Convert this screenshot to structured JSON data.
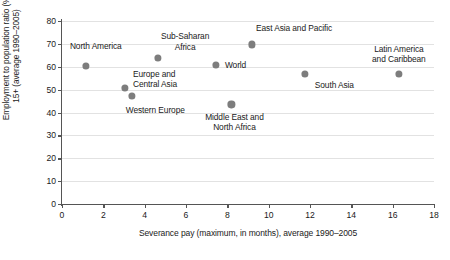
{
  "chart_data": {
    "type": "scatter",
    "title": "",
    "xlabel": "Severance pay (maximum, in months), average 1990–2005",
    "ylabel_line1": "Employment to population ratio (%),",
    "ylabel_line2": "15+ (average 1990–2005)",
    "xlim": [
      0,
      18
    ],
    "ylim": [
      0,
      80
    ],
    "xticks": [
      0,
      2,
      4,
      6,
      8,
      10,
      12,
      14,
      16,
      18
    ],
    "yticks": [
      0,
      10,
      20,
      30,
      40,
      50,
      60,
      70,
      80
    ],
    "grid": "horizontal",
    "legend": "none",
    "marker_color": "#7d7d7d",
    "axis_color": "#555555",
    "gridline_color": "#e2e2e2",
    "points": [
      {
        "label": "North America",
        "label_lines": [
          "North America"
        ],
        "x": 1.15,
        "y": 60.2,
        "label_align": "center",
        "label_dx": 10,
        "label_dy": -20
      },
      {
        "label": "Europe and Central Asia",
        "label_lines": [
          "Europe and",
          "Central Asia"
        ],
        "x": 3.05,
        "y": 50.8,
        "label_align": "left",
        "label_dx": 8,
        "label_dy": -9
      },
      {
        "label": "Western Europe",
        "label_lines": [
          "Western Europe"
        ],
        "x": 3.4,
        "y": 47.2,
        "label_align": "center",
        "label_dx": 23,
        "label_dy": 14
      },
      {
        "label": "Sub-Saharan Africa",
        "label_lines": [
          "Sub-Saharan",
          "Africa"
        ],
        "x": 4.65,
        "y": 64.0,
        "label_align": "center",
        "label_dx": 27,
        "label_dy": -16
      },
      {
        "label": "World",
        "label_lines": [
          "World"
        ],
        "x": 7.45,
        "y": 60.8,
        "label_align": "left",
        "label_dx": 9,
        "label_dy": 0
      },
      {
        "label": "Middle East and North Africa",
        "label_lines": [
          "Middle East and",
          "North Africa"
        ],
        "x": 8.2,
        "y": 43.5,
        "label_align": "center",
        "label_dx": 3,
        "label_dy": 18
      },
      {
        "label": "East Asia and Pacific",
        "label_lines": [
          "East Asia and Pacific"
        ],
        "x": 9.2,
        "y": 69.8,
        "label_align": "center",
        "label_dx": 42,
        "label_dy": -16
      },
      {
        "label": "South Asia",
        "label_lines": [
          "South Asia"
        ],
        "x": 11.75,
        "y": 57.0,
        "label_align": "left",
        "label_dx": 10,
        "label_dy": 11
      },
      {
        "label": "Latin America and Caribbean",
        "label_lines": [
          "Latin America",
          "and Caribbean"
        ],
        "x": 16.3,
        "y": 56.7,
        "label_align": "center",
        "label_dx": 0,
        "label_dy": -20
      }
    ]
  }
}
